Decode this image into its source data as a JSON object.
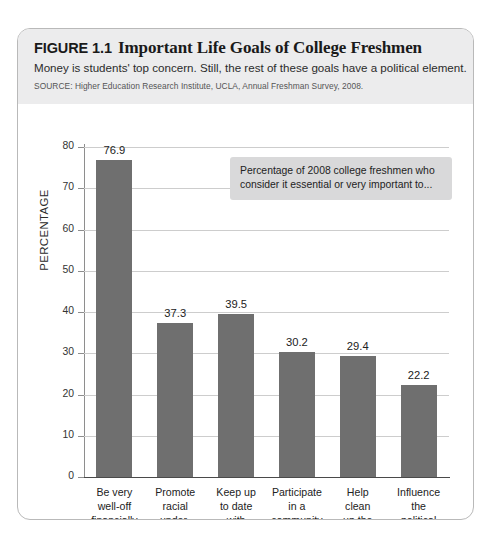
{
  "figure": {
    "number": "FIGURE 1.1",
    "title": "Important Life Goals of College Freshmen",
    "subtitle": "Money is students' top concern. Still, the rest of these goals have a political element.",
    "source": "SOURCE: Higher Education Research Institute, UCLA, Annual Freshman Survey, 2008."
  },
  "callout": {
    "text": "Percentage of 2008 college freshmen who consider it essential or very important to..."
  },
  "colors": {
    "bar": "#6f6f6f",
    "header_band": "#ececed",
    "callout_background": "#d9d9da",
    "gridline": "#cdcdcd",
    "card_border": "#b9b9b9"
  },
  "chart_data": {
    "type": "bar",
    "title": "Important Life Goals of College Freshmen",
    "subtitle": "Money is students' top concern. Still, the rest of these goals have a political element.",
    "source": "SOURCE: Higher Education Research Institute, UCLA, Annual Freshman Survey, 2008.",
    "xlabel": "",
    "ylabel": "PERCENTAGE",
    "ylim": [
      0,
      80
    ],
    "yticks": [
      0,
      10,
      20,
      30,
      40,
      50,
      60,
      70,
      80
    ],
    "ytick_labels": [
      "0",
      "10",
      "20",
      "30",
      "40",
      "50",
      "60",
      "70",
      "80"
    ],
    "grid": true,
    "legend": "none",
    "annotation": "Percentage of 2008 college freshmen who consider it essential or very important to...",
    "categories": [
      "Be very\nwell-off\nfinancially",
      "Promote\nracial\nunder-\nstanding",
      "Keep up\nto date\nwith\npolitics",
      "Participate\nin a\ncommunity\nprogram",
      "Help\nclean\nup the\nenvironment",
      "Influence\nthe\npolitical\nstructure"
    ],
    "values": [
      76.9,
      37.3,
      39.5,
      30.2,
      29.4,
      22.2
    ],
    "value_labels": [
      "76.9",
      "37.3",
      "39.5",
      "30.2",
      "29.4",
      "22.2"
    ]
  }
}
